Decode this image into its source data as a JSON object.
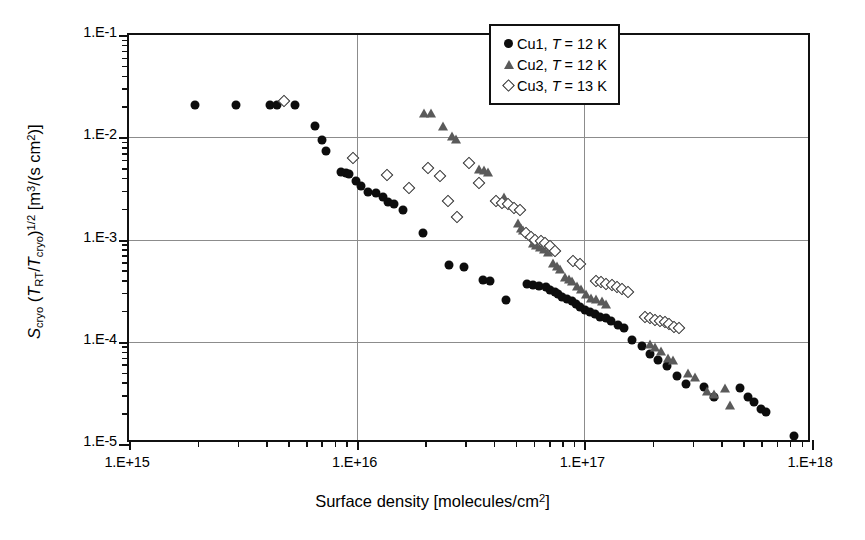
{
  "chart_data": {
    "type": "scatter",
    "title": "",
    "xlabel": "Surface density [molecules/cm2]",
    "ylabel": "Scryo (TRT/Tcryo)^1/2 [m3/(s cm2)]",
    "xscale": "log",
    "yscale": "log",
    "xlim": [
      1000000000000000.0,
      1e+18
    ],
    "ylim": [
      1e-05,
      0.1
    ],
    "grid": true,
    "legend_position": "top-right",
    "x_tick_labels": [
      "1.E+15",
      "1.E+16",
      "1.E+17",
      "1.E+18"
    ],
    "x_tick_values": [
      1000000000000000.0,
      1e+16,
      1e+17,
      1e+18
    ],
    "y_tick_labels": [
      "1.E-1",
      "1.E-2",
      "1.E-3",
      "1.E-4",
      "1.E-5"
    ],
    "y_tick_values": [
      0.1,
      0.01,
      0.001,
      0.0001,
      1e-05
    ],
    "series": [
      {
        "name": "Cu1",
        "legend_label": "Cu1, T = 12 K",
        "marker": "filled-circle",
        "color": "#0d0d0d",
        "temperature_K": 12,
        "points": [
          [
            1950000000000000.0,
            0.0205
          ],
          [
            2950000000000000.0,
            0.0205
          ],
          [
            4150000000000000.0,
            0.0205
          ],
          [
            4450000000000000.0,
            0.0205
          ],
          [
            5350000000000000.0,
            0.0205
          ],
          [
            6550000000000000.0,
            0.013
          ],
          [
            7050000000000000.0,
            0.0093
          ],
          [
            7350000000000000.0,
            0.0074
          ],
          [
            8550000000000000.0,
            0.0046
          ],
          [
            8950000000000000.0,
            0.0045
          ],
          [
            9300000000000000.0,
            0.0044
          ],
          [
            9900000000000000.0,
            0.0037
          ],
          [
            1.04e+16,
            0.0033
          ],
          [
            1.12e+16,
            0.0029
          ],
          [
            1.22e+16,
            0.00285
          ],
          [
            1.3e+16,
            0.0026
          ],
          [
            1.37e+16,
            0.00235
          ],
          [
            1.46e+16,
            0.0022
          ],
          [
            1.6e+16,
            0.00195
          ],
          [
            1.95e+16,
            0.00115
          ],
          [
            2.55e+16,
            0.00056
          ],
          [
            2.95e+16,
            0.00054
          ],
          [
            3.6e+16,
            0.0004
          ],
          [
            3.85e+16,
            0.000395
          ],
          [
            4.55e+16,
            0.000255
          ],
          [
            5.6e+16,
            0.00037
          ],
          [
            5.95e+16,
            0.00036
          ],
          [
            6.35e+16,
            0.00035
          ],
          [
            6.8e+16,
            0.000345
          ],
          [
            7.1e+16,
            0.00032
          ],
          [
            7.4e+16,
            0.00031
          ],
          [
            7.7e+16,
            0.000295
          ],
          [
            8e+16,
            0.000275
          ],
          [
            8.4e+16,
            0.00026
          ],
          [
            8.8e+16,
            0.00025
          ],
          [
            9.2e+16,
            0.000235
          ],
          [
            9.6e+16,
            0.00022
          ],
          [
            1.01e+17,
            0.000205
          ],
          [
            1.06e+17,
            0.000195
          ],
          [
            1.11e+17,
            0.000185
          ],
          [
            1.17e+17,
            0.000175
          ],
          [
            1.24e+17,
            0.00017
          ],
          [
            1.31e+17,
            0.00016
          ],
          [
            1.4e+17,
            0.000145
          ],
          [
            1.5e+17,
            0.000135
          ],
          [
            1.62e+17,
            0.000105
          ],
          [
            1.8e+17,
            9e-05
          ],
          [
            1.95e+17,
            7.6e-05
          ],
          [
            2.1e+17,
            6.6e-05
          ],
          [
            2.3e+17,
            5.8e-05
          ],
          [
            2.55e+17,
            4.6e-05
          ],
          [
            2.8e+17,
            3.9e-05
          ],
          [
            3.35e+17,
            3.6e-05
          ],
          [
            3.7e+17,
            2.9e-05
          ],
          [
            4.85e+17,
            3.5e-05
          ],
          [
            5.25e+17,
            2.85e-05
          ],
          [
            5.55e+17,
            2.55e-05
          ],
          [
            5.95e+17,
            2.2e-05
          ],
          [
            6.3e+17,
            2.05e-05
          ],
          [
            8.35e+17,
            1.2e-05
          ]
        ]
      },
      {
        "name": "Cu2",
        "legend_label": "Cu2, T = 12 K",
        "marker": "filled-triangle",
        "color": "#5a5a5a",
        "temperature_K": 12,
        "points": [
          [
            1.98e+16,
            0.0172
          ],
          [
            2.12e+16,
            0.0172
          ],
          [
            2.4e+16,
            0.013
          ],
          [
            2.62e+16,
            0.0102
          ],
          [
            2.72e+16,
            0.0096
          ],
          [
            3.45e+16,
            0.0049
          ],
          [
            3.62e+16,
            0.0048
          ],
          [
            3.78e+16,
            0.0046
          ],
          [
            4.45e+16,
            0.0026
          ],
          [
            4.6e+16,
            0.00225
          ],
          [
            5.1e+16,
            0.00145
          ],
          [
            5.25e+16,
            0.0013
          ],
          [
            5.4e+16,
            0.00125
          ],
          [
            5.95e+16,
            0.00092
          ],
          [
            6.15e+16,
            0.00088
          ],
          [
            6.4e+16,
            0.00084
          ],
          [
            6.65e+16,
            0.0008
          ],
          [
            6.95e+16,
            0.00076
          ],
          [
            7.25e+16,
            0.00059
          ],
          [
            7.55e+16,
            0.00055
          ],
          [
            7.85e+16,
            0.00052
          ],
          [
            8.2e+16,
            0.00043
          ],
          [
            8.55e+16,
            0.00041
          ],
          [
            8.85e+16,
            0.00039
          ],
          [
            9.25e+16,
            0.00035
          ],
          [
            9.65e+16,
            0.00033
          ],
          [
            1.02e+17,
            0.00029
          ],
          [
            1.07e+17,
            0.00027
          ],
          [
            1.13e+17,
            0.00026
          ],
          [
            1.19e+17,
            0.00025
          ],
          [
            1.25e+17,
            0.000235
          ],
          [
            1.95e+17,
            9.5e-05
          ],
          [
            2.05e+17,
            8.8e-05
          ],
          [
            2.18e+17,
            8.2e-05
          ],
          [
            2.32e+17,
            7e-05
          ],
          [
            2.45e+17,
            6.6e-05
          ],
          [
            2.85e+17,
            5e-05
          ],
          [
            3.05e+17,
            4.5e-05
          ],
          [
            3.45e+17,
            3.3e-05
          ],
          [
            3.7e+17,
            3.1e-05
          ],
          [
            4.15e+17,
            3.5e-05
          ],
          [
            4.35e+17,
            2.4e-05
          ]
        ]
      },
      {
        "name": "Cu3",
        "legend_label": "Cu3, T = 13 K",
        "marker": "open-diamond",
        "color": "#2b2b2b",
        "temperature_K": 13,
        "points": [
          [
            4800000000000000.0,
            0.0225
          ],
          [
            9650000000000000.0,
            0.0062
          ],
          [
            1.36e+16,
            0.0043
          ],
          [
            1.7e+16,
            0.0032
          ],
          [
            2.05e+16,
            0.005
          ],
          [
            2.32e+16,
            0.0042
          ],
          [
            2.52e+16,
            0.0024
          ],
          [
            2.75e+16,
            0.00165
          ],
          [
            3.1e+16,
            0.0056
          ],
          [
            3.45e+16,
            0.0036
          ],
          [
            4.1e+16,
            0.0024
          ],
          [
            4.35e+16,
            0.0023
          ],
          [
            4.6e+16,
            0.0022
          ],
          [
            4.9e+16,
            0.00205
          ],
          [
            5.2e+16,
            0.00195
          ],
          [
            5.55e+16,
            0.00115
          ],
          [
            5.85e+16,
            0.00105
          ],
          [
            6.1e+16,
            0.001
          ],
          [
            6.45e+16,
            0.00096
          ],
          [
            6.75e+16,
            0.00092
          ],
          [
            7.05e+16,
            0.00086
          ],
          [
            7.4e+16,
            0.00078
          ],
          [
            8.95e+16,
            0.00062
          ],
          [
            9.6e+16,
            0.00058
          ],
          [
            1.12e+17,
            0.00039
          ],
          [
            1.18e+17,
            0.00038
          ],
          [
            1.25e+17,
            0.00037
          ],
          [
            1.32e+17,
            0.00036
          ],
          [
            1.39e+17,
            0.00034
          ],
          [
            1.47e+17,
            0.00033
          ],
          [
            1.56e+17,
            0.00031
          ],
          [
            1.85e+17,
            0.000175
          ],
          [
            1.95e+17,
            0.00017
          ],
          [
            2.05e+17,
            0.000165
          ],
          [
            2.15e+17,
            0.00016
          ],
          [
            2.25e+17,
            0.000155
          ],
          [
            2.36e+17,
            0.00015
          ],
          [
            2.48e+17,
            0.00014
          ],
          [
            2.6e+17,
            0.000135
          ]
        ]
      }
    ]
  },
  "axes": {
    "x_title_prefix": "Surface density [molecules/cm",
    "x_title_sup": "2",
    "x_title_suffix": "]",
    "y_title_parts": {
      "S": "S",
      "S_sub": "cryo",
      "open": " (",
      "T1": "T",
      "T1_sub": "RT",
      "slash": "/",
      "T2": "T",
      "T2_sub": "cryo",
      "close": ")",
      "power": "1/2",
      "unit_open": " [m",
      "unit_m_sup": "3",
      "unit_mid": "/(s cm",
      "unit_cm_sup": "2",
      "unit_close": ")]"
    }
  },
  "legend": {
    "rows": [
      {
        "symbol": "filled-circle",
        "label": "Cu1, ",
        "italic": "T",
        "rest": " = 12 K"
      },
      {
        "symbol": "filled-triangle",
        "label": "Cu2, ",
        "italic": "T",
        "rest": " = 12 K"
      },
      {
        "symbol": "open-diamond",
        "label": "Cu3, ",
        "italic": "T",
        "rest": " = 13 K"
      }
    ]
  }
}
